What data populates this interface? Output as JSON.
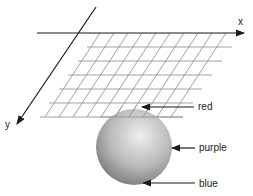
{
  "axes": {
    "x_label": "x",
    "y_label": "y"
  },
  "annotations": [
    {
      "label": "red",
      "target": "top of sphere"
    },
    {
      "label": "purple",
      "target": "side of sphere"
    },
    {
      "label": "blue",
      "target": "bottom of sphere"
    }
  ],
  "colors": {
    "axis": "#1a1a1a",
    "grid": "#8a8a8a",
    "sphere_light": "#e8e8e8",
    "sphere_dark": "#7a7a7a"
  }
}
